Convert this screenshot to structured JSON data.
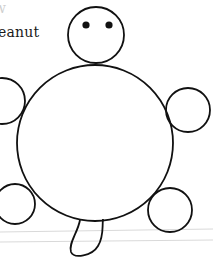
{
  "caption": {
    "top_fragment": "w",
    "text": "eanut"
  },
  "figure": {
    "stroke_color": "#111111",
    "ruled_line_color": "#d9d9d9",
    "head": {
      "cx": 96,
      "cy": 35,
      "r": 28
    },
    "eyes": [
      {
        "cx": 86,
        "cy": 25,
        "r": 3.6
      },
      {
        "cx": 109,
        "cy": 25,
        "r": 3.6
      }
    ],
    "body": {
      "cx": 95,
      "cy": 143,
      "r": 78
    },
    "limbs": [
      {
        "name": "front-left",
        "cx": 2,
        "cy": 101,
        "r": 23
      },
      {
        "name": "front-right",
        "cx": 188,
        "cy": 110,
        "r": 22
      },
      {
        "name": "back-left",
        "cx": 15,
        "cy": 204,
        "r": 20
      },
      {
        "name": "back-right",
        "cx": 170,
        "cy": 210,
        "r": 22
      }
    ],
    "tail_path": "M 80 220 C 78 232, 68 244, 71 252 C 74 259, 92 256, 98 246 C 104 236, 102 228, 103 219",
    "ruled_lines": [
      {
        "x1": 0,
        "y1": 232,
        "x2": 213,
        "y2": 229
      },
      {
        "x1": 0,
        "y1": 242,
        "x2": 213,
        "y2": 240
      }
    ]
  }
}
